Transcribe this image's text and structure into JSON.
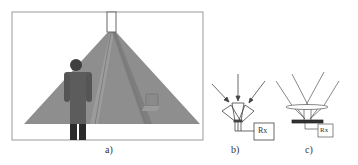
{
  "figure": {
    "panels": [
      {
        "id": "a",
        "label": "a)",
        "description": "Room with ceiling-mounted optical transmitter emitting a wide cone of light; a standing person and a laptop inside the illuminated area"
      },
      {
        "id": "b",
        "label": "b)",
        "description": "Angle-diversity receiver: three photodetectors oriented in different directions, connected to Rx",
        "rx_label": "Rx"
      },
      {
        "id": "c",
        "label": "c)",
        "description": "Imaging receiver: lens focusing incident rays onto a photodetector array, connected to Rx",
        "rx_label": "Rx"
      }
    ]
  },
  "colors": {
    "beam": "#8c8c8c",
    "beam_inner": "#9a9a9a",
    "person": "#555555",
    "person_legs": "#2b2b2b",
    "line": "#444444",
    "frame": "#999999"
  }
}
